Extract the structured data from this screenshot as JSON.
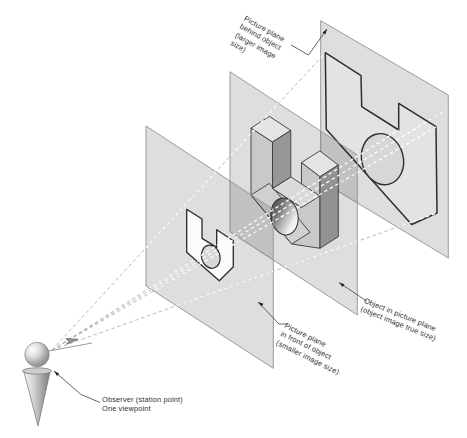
{
  "diagram": {
    "type": "perspective-projection-concept-figure",
    "labels": {
      "plane_behind": "Picture plane\nbehind object\n(larger image\nsize)",
      "object_plane": "Object in picture plane\n(object image true size)",
      "plane_front": "Picture plane\nin front of object\n(smaller image size)",
      "observer": "Observer (station point)\nOne viewpoint"
    },
    "elements": {
      "planes": [
        {
          "name": "picture-plane-in-front-of-object",
          "image": "smaller image of object"
        },
        {
          "name": "object-picture-plane",
          "image": "object true size"
        },
        {
          "name": "picture-plane-behind-object",
          "image": "larger image of object"
        }
      ],
      "observer": "push-pin figure with eye sphere and sight-direction dart",
      "rays": "dashed projection rays from station point through picture planes"
    },
    "colors": {
      "background": "#ffffff",
      "plane_fill_overlay": "rgba(0,0,0,0.13)",
      "plane_edge": "#9b9b9b",
      "image_outline": "#2e2e2e",
      "image_small_fill": "#fbfbfb",
      "image_large_fill": "#e3e3e3",
      "object_front": "#c9c9c9",
      "object_top": "#e4e4e4",
      "object_dark_side": "#929292",
      "object_chamfer": "#d0d0d0",
      "ray_gray": "#b3b3b3",
      "ray_white": "#ffffff",
      "leader_line": "#4a4a4a",
      "text": "#2f2f2f"
    }
  }
}
